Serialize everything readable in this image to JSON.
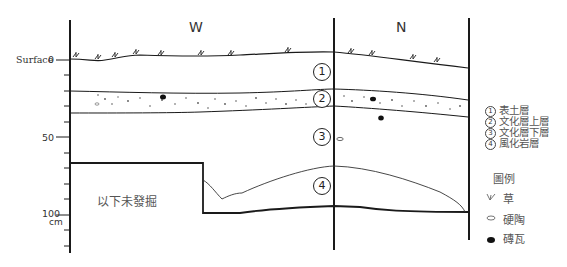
{
  "diagram": {
    "type": "stratigraphic-section",
    "directions": {
      "west": "W",
      "north": "N"
    },
    "scale": {
      "surface_label": "Surface",
      "tick_labels": [
        "0",
        "50",
        "100"
      ],
      "unit": "cm"
    },
    "unexcavated_label": "以下未發掘",
    "layer_markers": [
      "1",
      "2",
      "3",
      "4"
    ],
    "layers": [
      {
        "num": "1",
        "label": "表土層"
      },
      {
        "num": "2",
        "label": "文化層上層"
      },
      {
        "num": "3",
        "label": "文化層下層"
      },
      {
        "num": "4",
        "label": "風化岩層"
      }
    ],
    "legend": {
      "title": "圖例",
      "items": [
        {
          "icon": "grass-icon",
          "label": "草"
        },
        {
          "icon": "pottery-icon",
          "label": "硬陶"
        },
        {
          "icon": "brick-tile-icon",
          "label": "磚瓦"
        }
      ]
    },
    "colors": {
      "line": "#1a1a1a",
      "text": "#444444"
    }
  }
}
